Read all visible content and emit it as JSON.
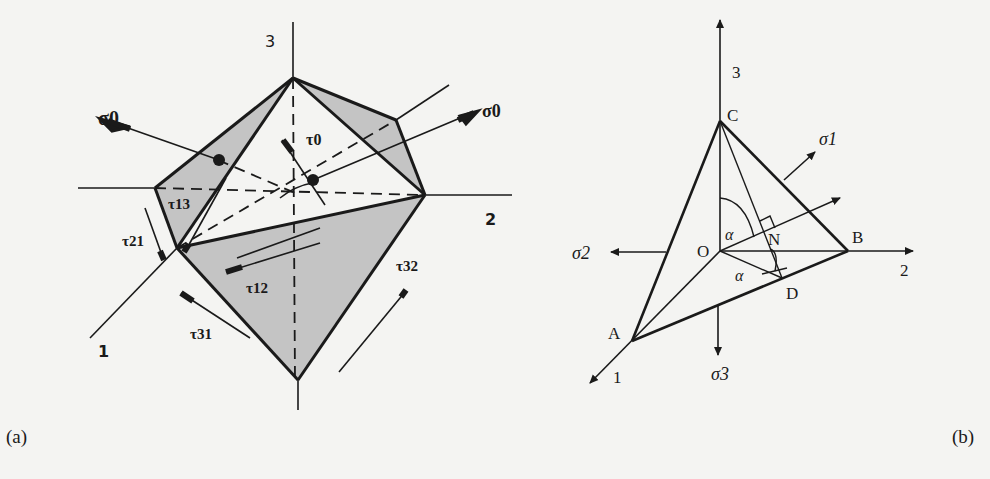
{
  "figure": {
    "panels": [
      {
        "id": "a",
        "caption": "(a)",
        "axes": {
          "axis1": "1",
          "axis2": "2",
          "axis3": "3"
        },
        "stress_labels": {
          "sigma0_left": "σ0",
          "sigma0_right": "σ0",
          "tau0": "τ0",
          "tau13": "τ13",
          "tau21": "τ21",
          "tau12": "τ12",
          "tau31": "τ31",
          "tau32": "τ32"
        }
      },
      {
        "id": "b",
        "caption": "(b)",
        "axes": {
          "axis1": "1",
          "axis2": "2",
          "axis3": "3"
        },
        "points": {
          "A": "A",
          "B": "B",
          "C": "C",
          "D": "D",
          "N": "N",
          "O": "O"
        },
        "angles": {
          "alpha_top": "α",
          "alpha_bottom": "α"
        },
        "stress_labels": {
          "sigma1": "σ1",
          "sigma2": "σ2",
          "sigma3": "σ3"
        }
      }
    ]
  },
  "colors": {
    "background": "#f4f4f2",
    "ink": "#1a1a1a",
    "shade": "#c4c4c4"
  }
}
